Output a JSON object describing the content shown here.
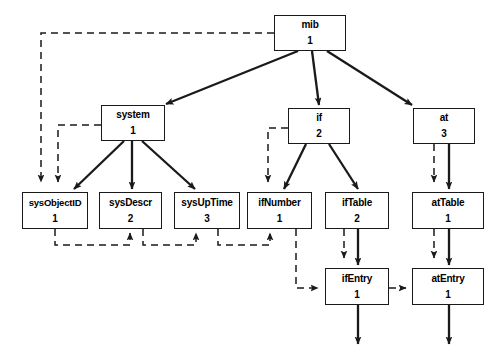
{
  "diagram": {
    "type": "tree-diagram",
    "background_color": "#ffffff",
    "line_color": "#1a1a1a",
    "solid_edge_meaning": "parent-to-child containment (solid arrow)",
    "dashed_edge_meaning": "lexicographic get-next traversal order (dashed arrow)",
    "nodes": [
      {
        "id": "mib",
        "label": "mib",
        "index": "1",
        "x": 274,
        "y": 15,
        "w": 72,
        "h": 36
      },
      {
        "id": "system",
        "label": "system",
        "index": "1",
        "x": 101,
        "y": 105,
        "w": 64,
        "h": 36
      },
      {
        "id": "if",
        "label": "if",
        "index": "2",
        "x": 288,
        "y": 108,
        "w": 62,
        "h": 36
      },
      {
        "id": "at",
        "label": "at",
        "index": "3",
        "x": 413,
        "y": 108,
        "w": 62,
        "h": 36
      },
      {
        "id": "sysObjectID",
        "label": "sysObjectID",
        "index": "1",
        "x": 22,
        "y": 192,
        "w": 66,
        "h": 37
      },
      {
        "id": "sysDescr",
        "label": "sysDescr",
        "index": "2",
        "x": 99,
        "y": 192,
        "w": 63,
        "h": 37
      },
      {
        "id": "sysUpTime",
        "label": "sysUpTime",
        "index": "3",
        "x": 174,
        "y": 192,
        "w": 66,
        "h": 37
      },
      {
        "id": "ifNumber",
        "label": "ifNumber",
        "index": "1",
        "x": 247,
        "y": 192,
        "w": 65,
        "h": 37
      },
      {
        "id": "ifTable",
        "label": "ifTable",
        "index": "2",
        "x": 325,
        "y": 192,
        "w": 64,
        "h": 37
      },
      {
        "id": "atTable",
        "label": "atTable",
        "index": "1",
        "x": 412,
        "y": 192,
        "w": 72,
        "h": 37
      },
      {
        "id": "ifEntry",
        "label": "ifEntry",
        "index": "1",
        "x": 325,
        "y": 268,
        "w": 64,
        "h": 37
      },
      {
        "id": "atEntry",
        "label": "atEntry",
        "index": "1",
        "x": 412,
        "y": 268,
        "w": 72,
        "h": 37
      }
    ],
    "solid_edges": [
      {
        "from": "mib",
        "to": "system"
      },
      {
        "from": "mib",
        "to": "if"
      },
      {
        "from": "mib",
        "to": "at"
      },
      {
        "from": "system",
        "to": "sysObjectID"
      },
      {
        "from": "system",
        "to": "sysDescr"
      },
      {
        "from": "system",
        "to": "sysUpTime"
      },
      {
        "from": "if",
        "to": "ifNumber"
      },
      {
        "from": "if",
        "to": "ifTable"
      },
      {
        "from": "at",
        "to": "atTable"
      },
      {
        "from": "ifTable",
        "to": "ifEntry"
      },
      {
        "from": "atTable",
        "to": "atEntry"
      },
      {
        "from": "ifEntry",
        "to": "below"
      },
      {
        "from": "atEntry",
        "to": "below"
      }
    ],
    "dashed_edges": [
      {
        "from": "mib",
        "to": "sysObjectID"
      },
      {
        "from": "system",
        "to": "sysObjectID"
      },
      {
        "from": "sysObjectID",
        "to": "sysDescr"
      },
      {
        "from": "sysDescr",
        "to": "sysUpTime"
      },
      {
        "from": "sysUpTime",
        "to": "ifNumber"
      },
      {
        "from": "if",
        "to": "ifNumber"
      },
      {
        "from": "ifNumber",
        "to": "ifEntry"
      },
      {
        "from": "ifTable",
        "to": "ifEntry"
      },
      {
        "from": "ifEntry",
        "to": "atEntry"
      },
      {
        "from": "at",
        "to": "atTable"
      },
      {
        "from": "atTable",
        "to": "atEntry"
      }
    ]
  }
}
